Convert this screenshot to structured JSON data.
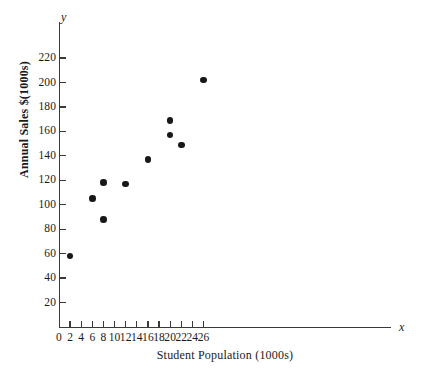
{
  "chart_data": {
    "type": "scatter",
    "title": "",
    "xlabel": "Student Population (1000s)",
    "ylabel": "Annual Sales $(1000s)",
    "x_axis_letter": "x",
    "y_axis_letter": "y",
    "xlim": [
      0,
      28
    ],
    "ylim": [
      0,
      230
    ],
    "xticks": [
      0,
      2,
      4,
      6,
      8,
      10,
      12,
      14,
      16,
      18,
      20,
      22,
      24,
      26
    ],
    "xtick_labels": [
      "0",
      "2",
      "4",
      "6",
      "8",
      "10",
      "12",
      "14",
      "16",
      "18",
      "20",
      "22",
      "24",
      "26"
    ],
    "yticks": [
      20,
      40,
      60,
      80,
      100,
      120,
      140,
      160,
      180,
      200,
      220
    ],
    "ytick_labels": [
      "20",
      "40",
      "60",
      "80",
      "100",
      "120",
      "140",
      "160",
      "180",
      "200",
      "220"
    ],
    "grid": false,
    "legend": null,
    "marker": "filled-circle",
    "marker_color": "#181818",
    "axis_color": "#3a3a3a",
    "background_color": "#ffffff",
    "points": [
      {
        "x": 2,
        "y": 58
      },
      {
        "x": 6,
        "y": 105
      },
      {
        "x": 8,
        "y": 88
      },
      {
        "x": 8,
        "y": 118
      },
      {
        "x": 12,
        "y": 117
      },
      {
        "x": 16,
        "y": 137
      },
      {
        "x": 20,
        "y": 157
      },
      {
        "x": 20,
        "y": 169
      },
      {
        "x": 22,
        "y": 149
      },
      {
        "x": 26,
        "y": 202
      }
    ]
  }
}
